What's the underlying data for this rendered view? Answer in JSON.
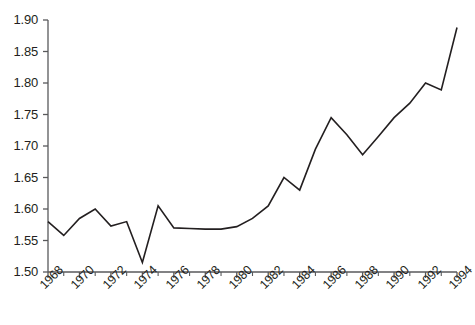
{
  "chart_data": {
    "type": "line",
    "title": "",
    "subtitle": "",
    "xlabel": "",
    "ylabel": "",
    "x": [
      1968,
      1969,
      1970,
      1971,
      1972,
      1973,
      1974,
      1975,
      1976,
      1977,
      1978,
      1979,
      1980,
      1981,
      1982,
      1983,
      1984,
      1985,
      1986,
      1987,
      1988,
      1989,
      1990,
      1991,
      1992,
      1993,
      1994
    ],
    "values": [
      1.58,
      1.558,
      1.585,
      1.6,
      1.573,
      1.58,
      1.515,
      1.605,
      1.57,
      1.569,
      1.568,
      1.568,
      1.572,
      1.585,
      1.605,
      1.65,
      1.63,
      1.695,
      1.745,
      1.718,
      1.686,
      1.715,
      1.745,
      1.768,
      1.8,
      1.789,
      1.888
    ],
    "series": [
      {
        "name": "series-1",
        "color": "#231f20",
        "values": [
          1.58,
          1.558,
          1.585,
          1.6,
          1.573,
          1.58,
          1.515,
          1.605,
          1.57,
          1.569,
          1.568,
          1.568,
          1.572,
          1.585,
          1.605,
          1.65,
          1.63,
          1.695,
          1.745,
          1.718,
          1.686,
          1.715,
          1.745,
          1.768,
          1.8,
          1.789,
          1.888
        ]
      }
    ],
    "xlim": [
      1968,
      1994
    ],
    "ylim": [
      1.5,
      1.9
    ],
    "ytick_values": [
      1.5,
      1.55,
      1.6,
      1.65,
      1.7,
      1.75,
      1.8,
      1.85,
      1.9
    ],
    "ytick_labels": [
      "1.50",
      "1.55",
      "1.60",
      "1.65",
      "1.70",
      "1.75",
      "1.80",
      "1.85",
      "1.90"
    ],
    "xtick_values": [
      1968,
      1970,
      1972,
      1974,
      1976,
      1978,
      1980,
      1982,
      1984,
      1986,
      1988,
      1990,
      1992,
      1994
    ],
    "xtick_labels": [
      "1968",
      "1970",
      "1972",
      "1974",
      "1976",
      "1978",
      "1980",
      "1982",
      "1984",
      "1986",
      "1988",
      "1990",
      "1992",
      "1994"
    ],
    "xminor_values": [
      1969,
      1971,
      1973,
      1975,
      1977,
      1979,
      1981,
      1983,
      1985,
      1987,
      1989,
      1991,
      1993
    ],
    "grid": false,
    "legend": false,
    "legend_position": "none",
    "axis_color": "#58595b",
    "line_color": "#231f20",
    "background_color": "#ffffff",
    "xlabel_rotation": -45
  }
}
